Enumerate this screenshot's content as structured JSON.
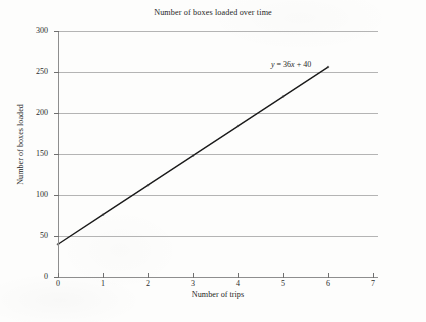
{
  "chart_data": {
    "type": "line",
    "title": "Number of boxes loaded over time",
    "xlabel": "Number of trips",
    "ylabel": "Number of boxes loaded",
    "xlim": [
      0,
      7
    ],
    "ylim": [
      0,
      300
    ],
    "xticks": [
      0,
      1,
      2,
      3,
      4,
      5,
      6,
      7
    ],
    "yticks": [
      0,
      50,
      100,
      150,
      200,
      250,
      300
    ],
    "xtick_labels": [
      "0",
      "1",
      "2",
      "3",
      "4",
      "5",
      "6",
      "7"
    ],
    "ytick_labels": [
      "0",
      "50",
      "100",
      "150",
      "200",
      "250",
      "300"
    ],
    "grid": "horizontal",
    "legend": "none",
    "series": [
      {
        "name": "boxes loaded",
        "x": [
          0,
          1,
          2,
          3,
          4,
          5,
          6
        ],
        "values": [
          40,
          76,
          112,
          148,
          184,
          220,
          256
        ],
        "color": "#1a1a1a",
        "marker": "small-dot"
      }
    ],
    "annotations": [
      {
        "name": "line-equation",
        "text": "y = 36x + 40",
        "text_y": "y",
        "text_mid": " = 36",
        "text_x": "x",
        "text_tail": " + 40",
        "x": 5.0,
        "y": 258
      }
    ],
    "equation": {
      "slope": 36,
      "intercept": 40,
      "formula": "y = 36x + 40"
    }
  },
  "colors": {
    "line": "#1a1a1a",
    "grid": "#b4b4b4",
    "axis": "#8e8e8e",
    "text": "#262626",
    "background": "#fdfdfc"
  }
}
